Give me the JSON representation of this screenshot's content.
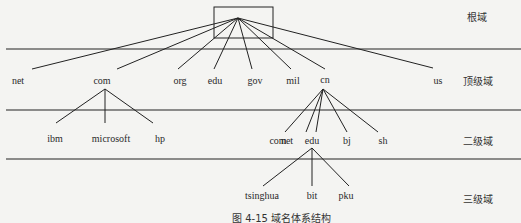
{
  "diagram": {
    "type": "tree",
    "caption": "图 4-15  域名体系结构",
    "levels": [
      {
        "id": "root",
        "label": "根域"
      },
      {
        "id": "tld",
        "label": "顶级域"
      },
      {
        "id": "second",
        "label": "二级域"
      },
      {
        "id": "third",
        "label": "三级域"
      }
    ],
    "top_level_domains": [
      "net",
      "com",
      "org",
      "edu",
      "gov",
      "mil",
      "cn",
      "us"
    ],
    "com_children": [
      "ibm",
      "microsoft",
      "hp"
    ],
    "cn_children": [
      "com",
      "net",
      "edu",
      "bj",
      "sh"
    ],
    "cn_edu_children": [
      "tsinghua",
      "bit",
      "pku"
    ],
    "edges": [
      {
        "from": "root",
        "to": "net"
      },
      {
        "from": "root",
        "to": "com"
      },
      {
        "from": "root",
        "to": "org"
      },
      {
        "from": "root",
        "to": "edu"
      },
      {
        "from": "root",
        "to": "gov"
      },
      {
        "from": "root",
        "to": "mil"
      },
      {
        "from": "root",
        "to": "cn"
      },
      {
        "from": "root",
        "to": "us"
      },
      {
        "from": "com",
        "to": "ibm"
      },
      {
        "from": "com",
        "to": "microsoft"
      },
      {
        "from": "com",
        "to": "hp"
      },
      {
        "from": "cn",
        "to": "cn.com"
      },
      {
        "from": "cn",
        "to": "cn.net"
      },
      {
        "from": "cn",
        "to": "cn.edu"
      },
      {
        "from": "cn",
        "to": "cn.bj"
      },
      {
        "from": "cn",
        "to": "cn.sh"
      },
      {
        "from": "cn.edu",
        "to": "tsinghua"
      },
      {
        "from": "cn.edu",
        "to": "bit"
      },
      {
        "from": "cn.edu",
        "to": "pku"
      }
    ],
    "colors": {
      "line": "#222222",
      "background": "#f4f4f2",
      "text": "#2a2a2a"
    }
  }
}
